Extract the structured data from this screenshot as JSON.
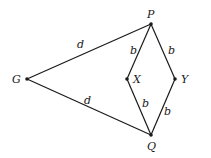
{
  "diagram": {
    "type": "graph",
    "nodes": [
      {
        "id": "P",
        "label": "P",
        "x": 151,
        "y": 24
      },
      {
        "id": "G",
        "label": "G",
        "x": 27,
        "y": 79
      },
      {
        "id": "X",
        "label": "X",
        "x": 127,
        "y": 79
      },
      {
        "id": "Y",
        "label": "Y",
        "x": 175,
        "y": 79
      },
      {
        "id": "Q",
        "label": "Q",
        "x": 151,
        "y": 135
      }
    ],
    "edges": [
      {
        "from": "G",
        "to": "P",
        "label": "d"
      },
      {
        "from": "G",
        "to": "Q",
        "label": "d"
      },
      {
        "from": "P",
        "to": "X",
        "label": "b"
      },
      {
        "from": "P",
        "to": "Y",
        "label": "b"
      },
      {
        "from": "X",
        "to": "Q",
        "label": "b"
      },
      {
        "from": "Y",
        "to": "Q",
        "label": "b"
      }
    ]
  },
  "labels": {
    "P": "P",
    "G": "G",
    "X": "X",
    "Y": "Y",
    "Q": "Q",
    "edge_GP": "d",
    "edge_GQ": "d",
    "edge_PX": "b",
    "edge_PY": "b",
    "edge_XQ": "b",
    "edge_YQ": "b"
  }
}
